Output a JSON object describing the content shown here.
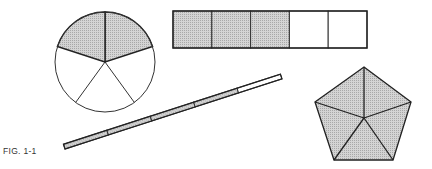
{
  "figure": {
    "caption": "FIG. 1-1",
    "shade_color": "#c8c8c8",
    "stroke_color": "#333333"
  },
  "shapes": [
    {
      "type": "circle",
      "parts": 5,
      "shaded": 2,
      "fraction": "2/5"
    },
    {
      "type": "rectangle",
      "parts": 5,
      "shaded": 3,
      "fraction": "3/5"
    },
    {
      "type": "bar",
      "parts": 5,
      "shaded": 4,
      "fraction": "4/5"
    },
    {
      "type": "pentagon",
      "parts": 5,
      "shaded": 5,
      "fraction": "5/5"
    }
  ]
}
